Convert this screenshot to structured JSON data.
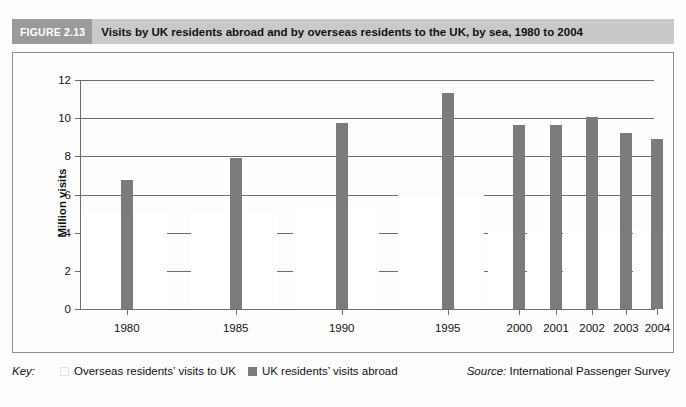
{
  "figure": {
    "number_label": "FIGURE 2.13",
    "title": "Visits by UK residents abroad and by overseas residents to the UK, by sea, 1980 to 2004",
    "band_color": "#c9c9c9",
    "number_band_color": "#9a9a9a"
  },
  "axis": {
    "y_title": "Million visits",
    "y_ticks": [
      "0",
      "2",
      "4",
      "6",
      "8",
      "10",
      "12"
    ]
  },
  "key": {
    "label": "Key:",
    "items": [
      {
        "label": "Overseas residents’ visits to UK",
        "color": "#ffffff",
        "swatch": "light-swatch"
      },
      {
        "label": "UK residents’ visits abroad",
        "color": "#7b7b7b",
        "swatch": "dark-swatch"
      }
    ]
  },
  "source": {
    "prefix": "Source:",
    "text": "International Passenger Survey"
  },
  "chart_data": {
    "type": "bar",
    "title": "Visits by UK residents abroad and by overseas residents to the UK, by sea, 1980 to 2004",
    "xlabel": "",
    "ylabel": "Million visits",
    "ylim": [
      0,
      12
    ],
    "yticks": [
      0,
      2,
      4,
      6,
      8,
      10,
      12
    ],
    "grid": true,
    "legend_position": "bottom-left",
    "categories": [
      "1980",
      "1985",
      "1990",
      "1995",
      "2000",
      "2001",
      "2002",
      "2003",
      "2004"
    ],
    "series": [
      {
        "name": "Overseas residents’ visits to UK",
        "color": "#ffffff",
        "values": [
          5.15,
          5.15,
          5.25,
          6.0,
          4.15,
          4.15,
          4.15,
          4.15,
          4.15
        ]
      },
      {
        "name": "UK residents’ visits abroad",
        "color": "#7b7b7b",
        "values": [
          6.75,
          7.9,
          9.75,
          11.3,
          9.65,
          9.65,
          10.05,
          9.2,
          8.9
        ]
      }
    ]
  },
  "layout": {
    "group_centers_pct": [
      8.0,
      27.0,
      45.5,
      64.0,
      76.5,
      82.9,
      89.2,
      95.1,
      100.6
    ],
    "light_band_left_pct": [
      0.0,
      19.2,
      37.0,
      55.3,
      71.0,
      77.8,
      84.2,
      90.3,
      96.4
    ],
    "light_band_width_pct": [
      15.0,
      15.0,
      15.0,
      15.0,
      5.6,
      5.6,
      5.6,
      5.6,
      5.6
    ]
  }
}
